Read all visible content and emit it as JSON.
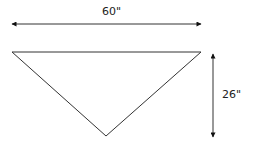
{
  "diagram": {
    "shape": "inverted triangle",
    "width_label": "60\"",
    "height_label": "26\"",
    "colors": {
      "stroke": "#333333",
      "background": "#ffffff"
    }
  }
}
